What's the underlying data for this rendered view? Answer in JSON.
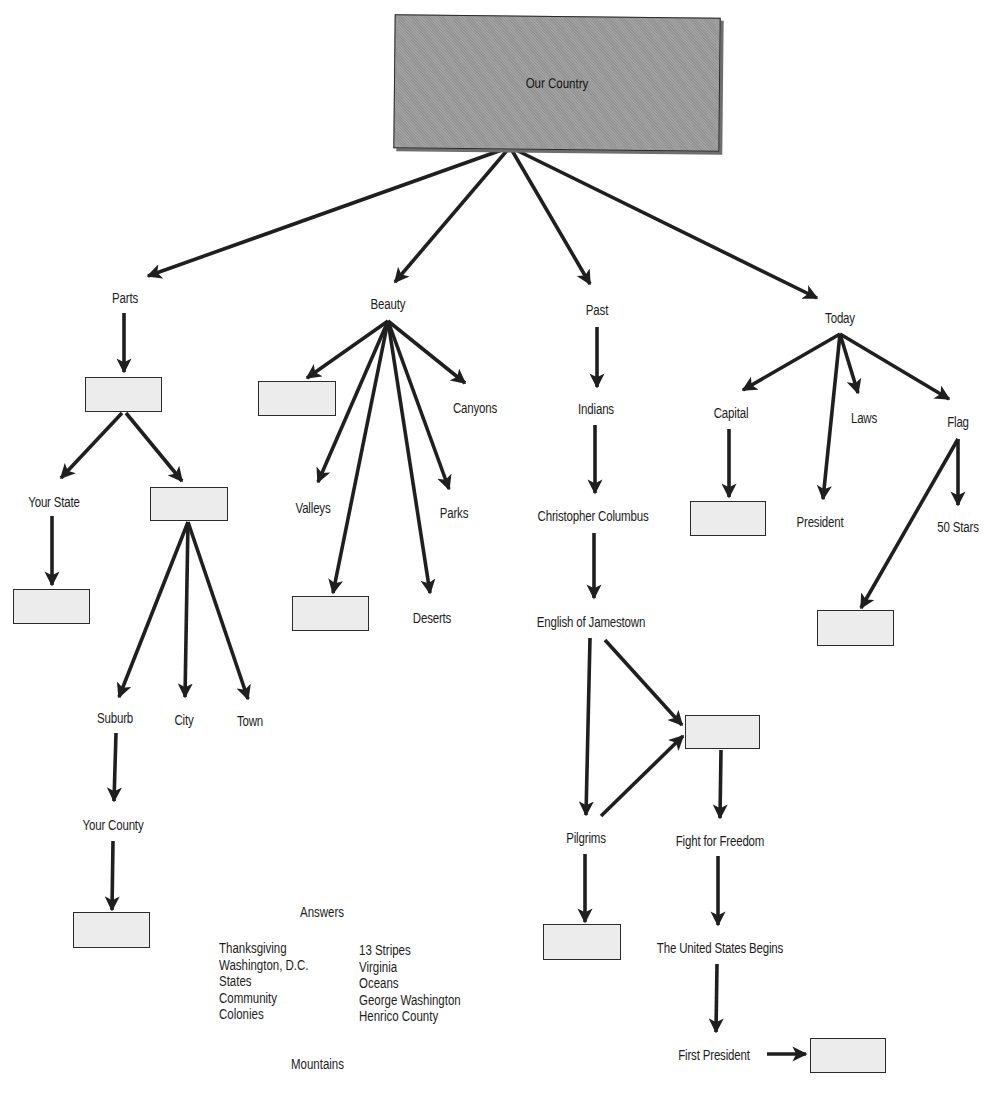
{
  "diagram": {
    "title": "Our Country",
    "branches": {
      "parts": {
        "label": "Parts",
        "children": {
          "your_state": "Your State",
          "suburb": "Suburb",
          "city": "City",
          "town": "Town",
          "your_county": "Your County"
        }
      },
      "beauty": {
        "label": "Beauty",
        "children": {
          "canyons": "Canyons",
          "valleys": "Valleys",
          "parks": "Parks",
          "deserts": "Deserts"
        }
      },
      "past": {
        "label": "Past",
        "children": {
          "indians": "Indians",
          "columbus": "Christopher Columbus",
          "jamestown": "English of Jamestown",
          "pilgrims": "Pilgrims",
          "fight": "Fight for Freedom",
          "us_begins": "The United States Begins",
          "first_president": "First President"
        }
      },
      "today": {
        "label": "Today",
        "children": {
          "capital": "Capital",
          "laws": "Laws",
          "flag": "Flag",
          "president": "President",
          "stars": "50 Stars"
        }
      }
    },
    "blank_boxes_count": 13
  },
  "answers": {
    "title": "Answers",
    "column1": [
      "Thanksgiving",
      "Washington, D.C.",
      "States",
      "Community",
      "Colonies"
    ],
    "column2": [
      "13 Stripes",
      "Virginia",
      "Oceans",
      "George Washington",
      "Henrico County"
    ],
    "extra": "Mountains"
  },
  "colors": {
    "root_fill": "#9b9b9b",
    "blank_fill": "#ececec",
    "line": "#1f1f1f"
  }
}
